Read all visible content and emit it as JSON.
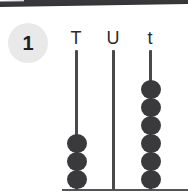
{
  "page": {
    "background_color": "#ffffff",
    "width": 188,
    "height": 193
  },
  "top_rule": {
    "name": "top-divider-bar",
    "color": "#38383a"
  },
  "step_badge": {
    "label": "1",
    "background_color": "#e9e9e9",
    "text_color": "#201f1f"
  },
  "abacus": {
    "base_line_color": "#555558",
    "rod_color": "#4a4a4c",
    "bead_color": "#3a3a3c",
    "columns": [
      {
        "label": "T",
        "label_name": "column-label-tens",
        "rod_name": "rod-tens",
        "beads": 3,
        "rod_x": 75,
        "rod_top": 50,
        "rod_bottom": 190,
        "label_x": 64,
        "label_y": 29
      },
      {
        "label": "U",
        "label_name": "column-label-units",
        "rod_name": "rod-units",
        "beads": 0,
        "rod_x": 112,
        "rod_top": 50,
        "rod_bottom": 190,
        "label_x": 101,
        "label_y": 29
      },
      {
        "label": "t",
        "label_name": "column-label-tenths",
        "rod_name": "rod-tenths",
        "beads": 6,
        "rod_x": 149,
        "rod_top": 50,
        "rod_bottom": 190,
        "label_x": 138,
        "label_y": 29
      }
    ]
  }
}
